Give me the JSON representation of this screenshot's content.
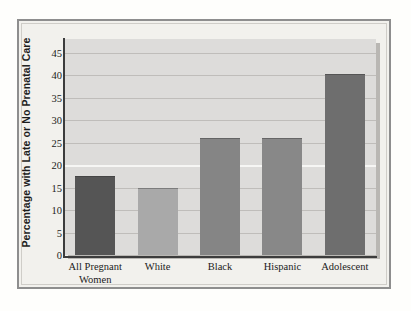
{
  "chart_data": {
    "type": "bar",
    "title": "",
    "subtitle": "",
    "xlabel": "",
    "ylabel": "Percentage with Late or No Prenatal Care",
    "categories": [
      "All Pregnant\nWomen",
      "White",
      "Black",
      "Hispanic",
      "Adolescent"
    ],
    "values": [
      17.5,
      15.0,
      26.0,
      26.0,
      40.3
    ],
    "series": [
      {
        "name": "Percentage with Late or No Prenatal Care",
        "values": [
          17.5,
          15.0,
          26.0,
          26.0,
          40.3
        ]
      }
    ],
    "bar_colors": [
      "#555555",
      "#a9a9a9",
      "#858585",
      "#888888",
      "#6e6e6e"
    ],
    "ylim": [
      0,
      48
    ],
    "ytick_labels": [
      "0",
      "5",
      "10",
      "15",
      "20",
      "25",
      "30",
      "35",
      "40",
      "45"
    ],
    "ytick_values": [
      0,
      5,
      10,
      15,
      20,
      25,
      30,
      35,
      40,
      45
    ],
    "grid": true,
    "grid_axis": "y",
    "legend": false,
    "legend_position": "none",
    "annotations": []
  },
  "figure": {
    "plot_background": "#dddcda",
    "page_background": "#f2f1ed",
    "frame_color": "#8e8e8e",
    "axis_color": "#3c3c3c",
    "gridline_color": "#bfbdba",
    "text_color": "#1b1b1b"
  }
}
